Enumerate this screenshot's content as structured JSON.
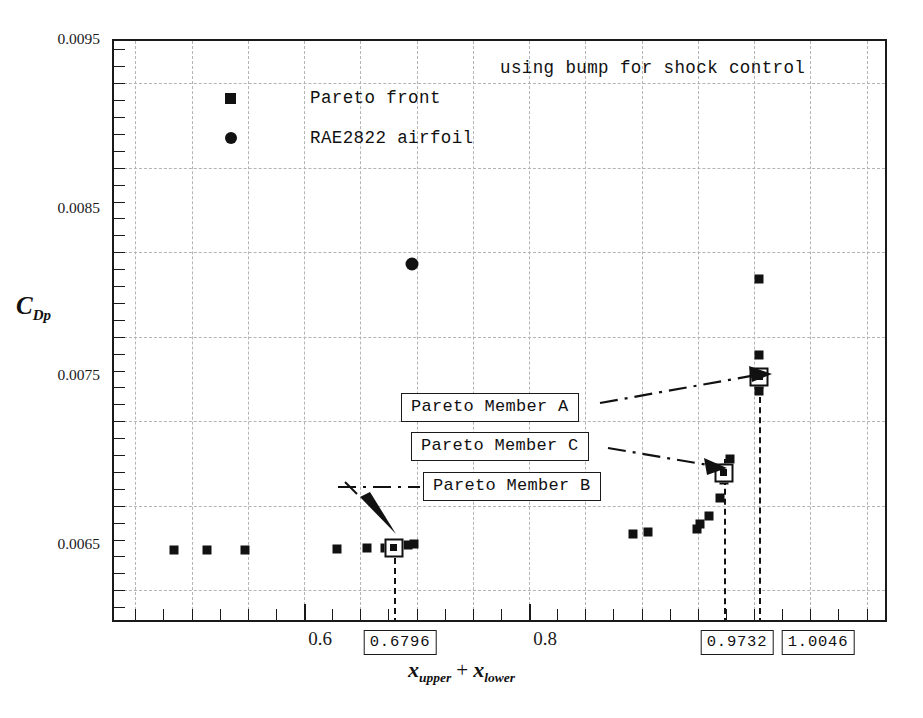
{
  "chart_data": {
    "type": "scatter",
    "title": "using bump for shock control",
    "xlabel": "x_upper + x_lower",
    "ylabel": "C_Dp",
    "xlim": [
      0.4311,
      1.12
    ],
    "ylim": [
      0.00605,
      0.0095
    ],
    "grid": true,
    "legend_position": "top-left-inside",
    "x_ticks_major": [
      0.6,
      0.8
    ],
    "x_tick_labels": [
      "0.6",
      "0.8"
    ],
    "y_ticks_major": [
      0.0065,
      0.0075,
      0.0085,
      0.0095
    ],
    "y_tick_labels": [
      "0.0065",
      "0.0075",
      "0.0085",
      "0.0095"
    ],
    "series": [
      {
        "name": "Pareto front",
        "marker": "square",
        "color": "#111111",
        "points": [
          {
            "x": 0.4845,
            "y": 0.006488
          },
          {
            "x": 0.5138,
            "y": 0.006488
          },
          {
            "x": 0.5476,
            "y": 0.006488
          },
          {
            "x": 0.6293,
            "y": 0.006492
          },
          {
            "x": 0.656,
            "y": 0.006498
          },
          {
            "x": 0.6718,
            "y": 0.006502
          },
          {
            "x": 0.6796,
            "y": 0.006502
          },
          {
            "x": 0.692,
            "y": 0.00652
          },
          {
            "x": 0.6973,
            "y": 0.006523
          },
          {
            "x": 0.8924,
            "y": 0.006582
          },
          {
            "x": 0.9058,
            "y": 0.006595
          },
          {
            "x": 0.9493,
            "y": 0.00661
          },
          {
            "x": 0.952,
            "y": 0.00664
          },
          {
            "x": 0.96,
            "y": 0.00669
          },
          {
            "x": 0.97,
            "y": 0.006795
          },
          {
            "x": 0.9732,
            "y": 0.0069
          },
          {
            "x": 0.9732,
            "y": 0.006945
          },
          {
            "x": 0.9745,
            "y": 0.006975
          },
          {
            "x": 0.979,
            "y": 0.007025
          },
          {
            "x": 1.0046,
            "y": 0.00743
          },
          {
            "x": 1.0046,
            "y": 0.00747
          },
          {
            "x": 1.0046,
            "y": 0.007512
          },
          {
            "x": 1.0046,
            "y": 0.00764
          },
          {
            "x": 1.0046,
            "y": 0.00809
          }
        ]
      },
      {
        "name": "RAE2822 airfoil",
        "marker": "circle",
        "color": "#111111",
        "points": [
          {
            "x": 0.696,
            "y": 0.00818
          }
        ]
      }
    ],
    "highlighted_points": [
      {
        "label": "Pareto Member A",
        "x": 1.0046,
        "y": 0.007512
      },
      {
        "label": "Pareto Member C",
        "x": 0.9732,
        "y": 0.006945
      },
      {
        "label": "Pareto Member B",
        "x": 0.6796,
        "y": 0.006502
      }
    ],
    "x_value_markers": [
      {
        "value": "0.6796",
        "x": 0.6796
      },
      {
        "value": "0.9732",
        "x": 0.9732
      },
      {
        "value": "1.0046",
        "x": 1.0046
      }
    ]
  },
  "legend": {
    "items": [
      {
        "label": "Pareto front",
        "marker": "square"
      },
      {
        "label": "RAE2822 airfoil",
        "marker": "circle"
      }
    ]
  },
  "axis": {
    "y_title_main": "C",
    "y_title_sub": "Dp",
    "x_title_part1": "x",
    "x_title_sub1": "upper",
    "x_title_plus": "+",
    "x_title_part2": "x",
    "x_title_sub2": "lower"
  },
  "annotations": [
    {
      "name": "pareto-member-a",
      "text": "Pareto Member A"
    },
    {
      "name": "pareto-member-c",
      "text": "Pareto Member C"
    },
    {
      "name": "pareto-member-b",
      "text": "Pareto Member B"
    }
  ],
  "x_value_labels": [
    "0.6796",
    "0.9732",
    "1.0046"
  ],
  "y_tick_labels": [
    "0.0095",
    "0.0085",
    "0.0075",
    "0.0065"
  ],
  "x_tick_labels": [
    "0.6",
    "0.8"
  ]
}
